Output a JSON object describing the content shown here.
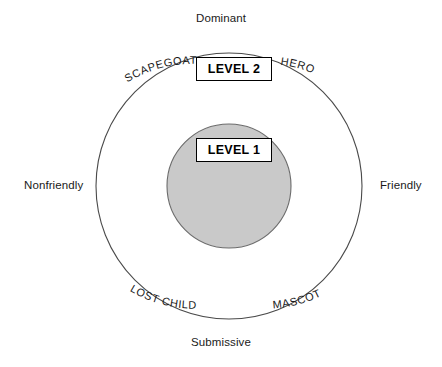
{
  "diagram": {
    "background_color": "#ffffff",
    "axis_color": "#000000",
    "outer_circle_color": "#4a4a4a",
    "inner_circle_fill": "#c9c9c9",
    "inner_circle_stroke": "#555555",
    "center": {
      "x": 229,
      "y": 186
    },
    "outer_radius": 133,
    "inner_radius": 62
  },
  "axes": {
    "vertical": {
      "top_label": "Dominant",
      "bottom_label": "Submissive"
    },
    "horizontal": {
      "left_label": "Nonfriendly",
      "right_label": "Friendly"
    }
  },
  "levels": [
    {
      "id": "level-2",
      "label": "LEVEL 2"
    },
    {
      "id": "level-1",
      "label": "LEVEL 1"
    }
  ],
  "roles": [
    {
      "id": "scapegoat",
      "label": "SCAPEGOAT",
      "quadrant": "dominant-nonfriendly"
    },
    {
      "id": "hero",
      "label": "HERO",
      "quadrant": "dominant-friendly"
    },
    {
      "id": "lost-child",
      "label": "LOST CHILD",
      "quadrant": "submissive-nonfriendly"
    },
    {
      "id": "mascot",
      "label": "MASCOT",
      "quadrant": "submissive-friendly"
    }
  ]
}
